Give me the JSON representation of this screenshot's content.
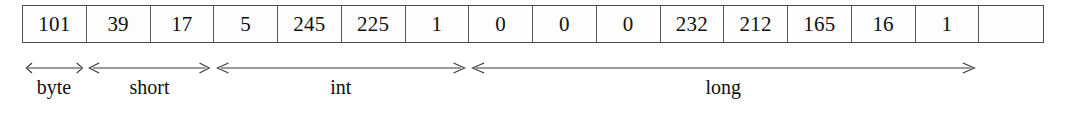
{
  "diagram": {
    "byte_cells": [
      {
        "value": "101"
      },
      {
        "value": "39"
      },
      {
        "value": "17"
      },
      {
        "value": "5"
      },
      {
        "value": "245"
      },
      {
        "value": "225"
      },
      {
        "value": "1"
      },
      {
        "value": "0"
      },
      {
        "value": "0"
      },
      {
        "value": "0"
      },
      {
        "value": "232"
      },
      {
        "value": "212"
      },
      {
        "value": "165"
      },
      {
        "value": "16"
      },
      {
        "value": "1"
      }
    ],
    "cell_count": 16,
    "spans": [
      {
        "label": "byte",
        "start_cell": 0,
        "cell_span": 1,
        "arrow": "double-headed"
      },
      {
        "label": "short",
        "start_cell": 1,
        "cell_span": 2,
        "arrow": "double-headed"
      },
      {
        "label": "int",
        "start_cell": 3,
        "cell_span": 4,
        "arrow": "double-headed"
      },
      {
        "label": "long",
        "start_cell": 7,
        "cell_span": 8,
        "arrow": "double-headed"
      }
    ],
    "colors": {
      "cell_border": "#4a4a4a",
      "cell_background": "#fdfdfd",
      "text": "#101010",
      "arrow": "#3a3a3a",
      "page_background": "#ffffff"
    }
  },
  "chart_data": {
    "type": "table",
    "categories": [
      "byte",
      "short",
      "int",
      "long"
    ],
    "values": [
      1,
      2,
      4,
      8
    ],
    "ylabel": "bytes",
    "cell_values": [
      101,
      39,
      17,
      5,
      245,
      225,
      1,
      0,
      0,
      0,
      232,
      212,
      165,
      16,
      1
    ]
  }
}
